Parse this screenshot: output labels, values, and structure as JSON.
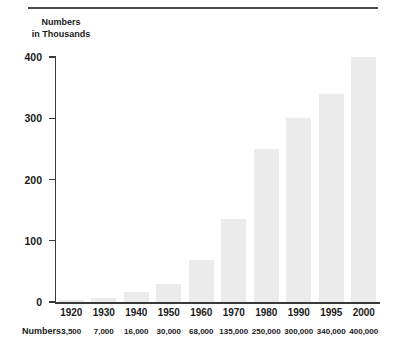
{
  "chart_data": {
    "type": "bar",
    "title": "",
    "ylabel": "Numbers in Thousands",
    "ylabel_lines": [
      "Numbers",
      "in Thousands"
    ],
    "xlabel": "",
    "categories": [
      "1920",
      "1930",
      "1940",
      "1950",
      "1960",
      "1970",
      "1980",
      "1990",
      "1995",
      "2000"
    ],
    "values": [
      3.5,
      7,
      16,
      30,
      68,
      135,
      250,
      300,
      340,
      400
    ],
    "value_labels": [
      "3,500",
      "7,000",
      "16,000",
      "30,000",
      "68,000",
      "135,000",
      "250,000",
      "300,000",
      "340,000",
      "400,000"
    ],
    "value_row_label": "Numbers:",
    "yticks": [
      0,
      100,
      200,
      300,
      400
    ],
    "ytick_labels": [
      "0",
      "100",
      "200",
      "300",
      "400"
    ],
    "ylim": [
      0,
      400
    ],
    "grid": false,
    "legend": null,
    "bar_color": "#ebebeb",
    "axis_color": "#3a3a3a"
  }
}
